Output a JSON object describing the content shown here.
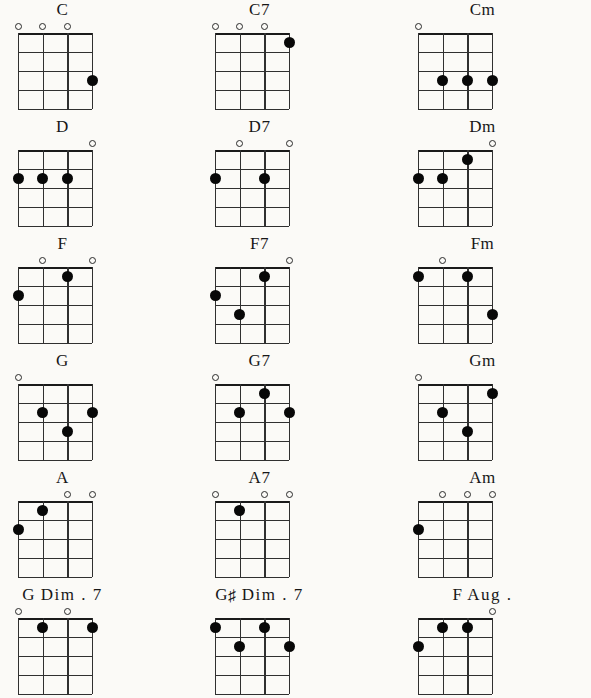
{
  "sheet": {
    "title_alt": "Ukulele Chord Chart",
    "background_color": "#fbfaf7",
    "ink_color": "#1a1a1a",
    "strings": 4,
    "frets": 4,
    "columns": 3,
    "rows": 6,
    "legend": {
      "open_string_symbol": "o",
      "fretted_note_symbol": "filled-dot"
    }
  },
  "chords": [
    {
      "name": "C",
      "label_parts": [
        {
          "text": "C",
          "type": "plain"
        }
      ],
      "open_strings": [
        1,
        2,
        3
      ],
      "dots": [
        {
          "string": 4,
          "fret": 3
        }
      ]
    },
    {
      "name": "C7",
      "label_parts": [
        {
          "text": "C7",
          "type": "plain"
        }
      ],
      "open_strings": [
        1,
        2,
        3
      ],
      "dots": [
        {
          "string": 4,
          "fret": 1
        }
      ]
    },
    {
      "name": "Cm",
      "label_parts": [
        {
          "text": "Cm",
          "type": "plain"
        }
      ],
      "open_strings": [
        1
      ],
      "dots": [
        {
          "string": 2,
          "fret": 3
        },
        {
          "string": 3,
          "fret": 3
        },
        {
          "string": 4,
          "fret": 3
        }
      ]
    },
    {
      "name": "D",
      "label_parts": [
        {
          "text": "D",
          "type": "plain"
        }
      ],
      "open_strings": [
        4
      ],
      "dots": [
        {
          "string": 1,
          "fret": 2
        },
        {
          "string": 2,
          "fret": 2
        },
        {
          "string": 3,
          "fret": 2
        }
      ]
    },
    {
      "name": "D7",
      "label_parts": [
        {
          "text": "D7",
          "type": "plain"
        }
      ],
      "open_strings": [
        2,
        4
      ],
      "dots": [
        {
          "string": 1,
          "fret": 2
        },
        {
          "string": 3,
          "fret": 2
        }
      ]
    },
    {
      "name": "Dm",
      "label_parts": [
        {
          "text": "Dm",
          "type": "plain"
        }
      ],
      "open_strings": [
        4
      ],
      "dots": [
        {
          "string": 1,
          "fret": 2
        },
        {
          "string": 2,
          "fret": 2
        },
        {
          "string": 3,
          "fret": 1
        }
      ]
    },
    {
      "name": "F",
      "label_parts": [
        {
          "text": "F",
          "type": "plain"
        }
      ],
      "open_strings": [
        2,
        4
      ],
      "dots": [
        {
          "string": 1,
          "fret": 2
        },
        {
          "string": 3,
          "fret": 1
        }
      ]
    },
    {
      "name": "F7",
      "label_parts": [
        {
          "text": "F7",
          "type": "plain"
        }
      ],
      "open_strings": [
        4
      ],
      "dots": [
        {
          "string": 1,
          "fret": 2
        },
        {
          "string": 2,
          "fret": 3
        },
        {
          "string": 3,
          "fret": 1
        }
      ]
    },
    {
      "name": "Fm",
      "label_parts": [
        {
          "text": "Fm",
          "type": "plain"
        }
      ],
      "open_strings": [
        2
      ],
      "dots": [
        {
          "string": 1,
          "fret": 1
        },
        {
          "string": 3,
          "fret": 1
        },
        {
          "string": 4,
          "fret": 3
        }
      ]
    },
    {
      "name": "G",
      "label_parts": [
        {
          "text": "G",
          "type": "plain"
        }
      ],
      "open_strings": [
        1
      ],
      "dots": [
        {
          "string": 2,
          "fret": 2
        },
        {
          "string": 3,
          "fret": 3
        },
        {
          "string": 4,
          "fret": 2
        }
      ]
    },
    {
      "name": "G7",
      "label_parts": [
        {
          "text": "G7",
          "type": "plain"
        }
      ],
      "open_strings": [
        1
      ],
      "dots": [
        {
          "string": 2,
          "fret": 2
        },
        {
          "string": 3,
          "fret": 1
        },
        {
          "string": 4,
          "fret": 2
        }
      ]
    },
    {
      "name": "Gm",
      "label_parts": [
        {
          "text": "Gm",
          "type": "plain"
        }
      ],
      "open_strings": [
        1
      ],
      "dots": [
        {
          "string": 2,
          "fret": 2
        },
        {
          "string": 3,
          "fret": 3
        },
        {
          "string": 4,
          "fret": 1
        }
      ]
    },
    {
      "name": "A",
      "label_parts": [
        {
          "text": "A",
          "type": "plain"
        }
      ],
      "open_strings": [
        3,
        4
      ],
      "dots": [
        {
          "string": 1,
          "fret": 2
        },
        {
          "string": 2,
          "fret": 1
        }
      ]
    },
    {
      "name": "A7",
      "label_parts": [
        {
          "text": "A7",
          "type": "plain"
        }
      ],
      "open_strings": [
        1,
        3,
        4
      ],
      "dots": [
        {
          "string": 2,
          "fret": 1
        }
      ]
    },
    {
      "name": "Am",
      "label_parts": [
        {
          "text": "Am",
          "type": "plain"
        }
      ],
      "open_strings": [
        2,
        3,
        4
      ],
      "dots": [
        {
          "string": 1,
          "fret": 2
        }
      ]
    },
    {
      "name": "G Dim. 7",
      "label_parts": [
        {
          "text": "G",
          "type": "plain"
        },
        {
          "text": "Dim . 7",
          "type": "spaced"
        }
      ],
      "open_strings": [
        1,
        3
      ],
      "dots": [
        {
          "string": 2,
          "fret": 1
        },
        {
          "string": 4,
          "fret": 1
        }
      ]
    },
    {
      "name": "G# Dim. 7",
      "label_parts": [
        {
          "text": "G",
          "type": "plain"
        },
        {
          "text": "♯",
          "type": "sharp"
        },
        {
          "text": "Dim . 7",
          "type": "spaced"
        }
      ],
      "open_strings": [],
      "dots": [
        {
          "string": 1,
          "fret": 1
        },
        {
          "string": 2,
          "fret": 2
        },
        {
          "string": 3,
          "fret": 1
        },
        {
          "string": 4,
          "fret": 2
        }
      ]
    },
    {
      "name": "F Aug.",
      "label_parts": [
        {
          "text": "F",
          "type": "plain"
        },
        {
          "text": "Aug .",
          "type": "spaced"
        }
      ],
      "open_strings": [
        4
      ],
      "dots": [
        {
          "string": 1,
          "fret": 2
        },
        {
          "string": 2,
          "fret": 1
        },
        {
          "string": 3,
          "fret": 1
        }
      ]
    }
  ],
  "layout": {
    "cell_width": 197,
    "cell_height": 117,
    "diagram_width": 74,
    "diagram_height": 76,
    "diagram_left_offsets": [
      18,
      18,
      24
    ],
    "title_left_offsets": [
      -36,
      -36,
      -10
    ]
  }
}
